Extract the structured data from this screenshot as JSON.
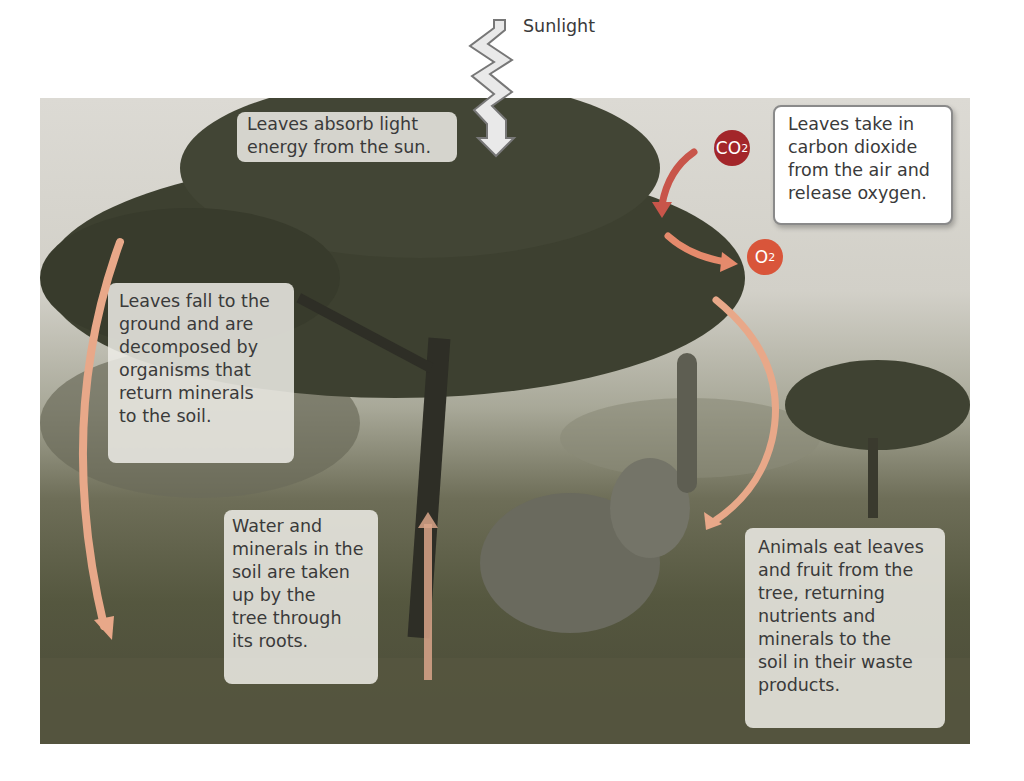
{
  "diagram": {
    "sunlight_label": "Sunlight",
    "callouts": {
      "absorb_light": "Leaves absorb light\nenergy from the sun.",
      "gas_exchange": "Leaves take in\ncarbon dioxide\nfrom the air and\nrelease oxygen.",
      "decomposition": "Leaves fall to the\nground and are\ndecomposed by\norganisms that\nreturn minerals\nto the soil.",
      "root_uptake": "Water and\nminerals in the\nsoil are taken\nup by the\ntree through\nits roots.",
      "animals": "Animals eat leaves\nand fruit from the\ntree, returning\nnutrients and\nminerals to the\nsoil in their waste\nproducts."
    },
    "gases": {
      "co2": {
        "base": "CO",
        "sub": "2",
        "color": "#a3262a"
      },
      "o2": {
        "base": "O",
        "sub": "2",
        "color": "#d9553a"
      }
    },
    "icons": [
      "sunlight-bolt-icon",
      "co2-arrow-icon",
      "o2-arrow-icon",
      "leaf-fall-arrow-icon",
      "root-uptake-arrow-icon",
      "animal-cycle-arrow-icon"
    ],
    "colors": {
      "arrow": "#e8a07a",
      "callout_text": "#3a3a3a",
      "background": "#ffffff"
    }
  }
}
